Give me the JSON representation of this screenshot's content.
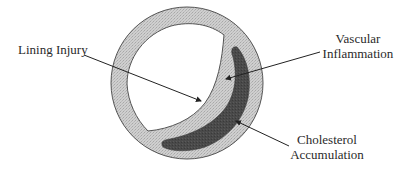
{
  "diagram": {
    "colors": {
      "wall": "#c9c9c9",
      "wall_outline": "#555555",
      "lumen": "#ffffff",
      "plaque": "#4a4a4a",
      "arrow": "#222222"
    },
    "labels": {
      "lining_injury": "Lining Injury",
      "vascular_inflammation_line1": "Vascular",
      "vascular_inflammation_line2": "Inflammation",
      "cholesterol_line1": "Cholesterol",
      "cholesterol_line2": "Accumulation"
    }
  }
}
